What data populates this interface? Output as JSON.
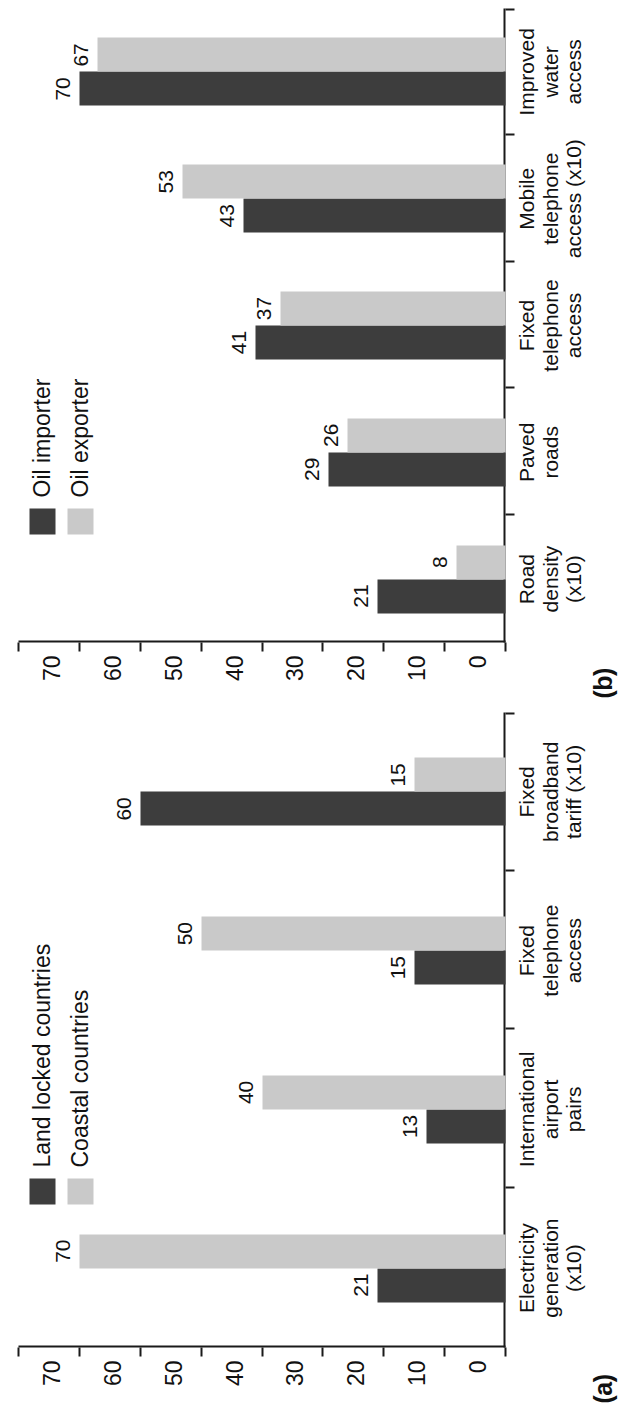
{
  "figure": {
    "panels": [
      {
        "tag": "(a)",
        "legend": [
          {
            "label": "Land locked countries",
            "color": "#3d3d3d",
            "swatch": "dark"
          },
          {
            "label": "Coastal countries",
            "color": "#c9c9c9",
            "swatch": "light"
          }
        ],
        "chart_data": {
          "type": "bar",
          "title": "(a)",
          "xlabel": "",
          "ylabel": "",
          "ylim": [
            0,
            80
          ],
          "yticks": [
            0,
            10,
            20,
            30,
            40,
            50,
            60,
            70,
            80
          ],
          "grid": false,
          "legend_position": "top-left",
          "categories": [
            "Electricity\ngeneration\n(x10)",
            "International\nairport\npairs",
            "Fixed\ntelephone\naccess",
            "Fixed\nbroadband\ntariff (x10)"
          ],
          "series": [
            {
              "name": "Land locked countries",
              "color": "#3d3d3d",
              "values": [
                21,
                13,
                15,
                60
              ]
            },
            {
              "name": "Coastal countries",
              "color": "#c9c9c9",
              "values": [
                70,
                40,
                50,
                15
              ]
            }
          ]
        }
      },
      {
        "tag": "(b)",
        "legend": [
          {
            "label": "Oil importer",
            "color": "#3d3d3d",
            "swatch": "dark"
          },
          {
            "label": "Oil exporter",
            "color": "#c9c9c9",
            "swatch": "light"
          }
        ],
        "chart_data": {
          "type": "bar",
          "title": "(b)",
          "xlabel": "",
          "ylabel": "",
          "ylim": [
            0,
            80
          ],
          "yticks": [
            0,
            10,
            20,
            30,
            40,
            50,
            60,
            70,
            80
          ],
          "grid": false,
          "legend_position": "top-left",
          "categories": [
            "Road\ndensity\n(x10)",
            "Paved\nroads",
            "Fixed\ntelephone\naccess",
            "Mobile\ntelephone\naccess (x10)",
            "Improved\nwater\naccess"
          ],
          "series": [
            {
              "name": "Oil importer",
              "color": "#3d3d3d",
              "values": [
                21,
                29,
                41,
                43,
                70
              ]
            },
            {
              "name": "Oil exporter",
              "color": "#c9c9c9",
              "values": [
                8,
                26,
                37,
                53,
                67
              ]
            }
          ]
        }
      }
    ]
  }
}
